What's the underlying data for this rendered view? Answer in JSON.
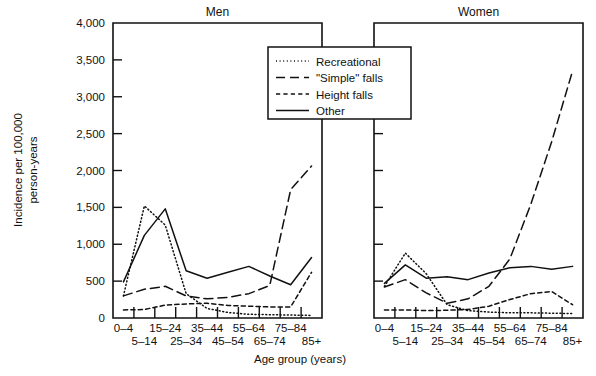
{
  "figure": {
    "y_axis_title": "Incidence per 100,000 person-years",
    "y_axis_title_line1": "Incidence per 100,000",
    "y_axis_title_line2": "person-years",
    "x_axis_title": "Age group (years)",
    "panels": [
      {
        "name": "men",
        "title": "Men"
      },
      {
        "name": "women",
        "title": "Women"
      }
    ]
  },
  "legend": {
    "position": "top-center",
    "items": [
      {
        "label": "Recreational",
        "style": "dotted"
      },
      {
        "label": "\"Simple\" falls",
        "style": "long-dash"
      },
      {
        "label": "Height falls",
        "style": "short-dash"
      },
      {
        "label": "Other",
        "style": "solid"
      }
    ]
  },
  "chart_data": {
    "type": "line",
    "title": "",
    "subtitle": "",
    "xlabel": "Age group (years)",
    "ylabel": "Incidence per 100,000 person-years",
    "ylim": [
      0,
      4000
    ],
    "ytick_values": [
      0,
      500,
      1000,
      1500,
      2000,
      2500,
      3000,
      3500,
      4000
    ],
    "ytick_labels": [
      "0",
      "500",
      "1,000",
      "1,500",
      "2,000",
      "2,500",
      "3,000",
      "3,500",
      "4,000"
    ],
    "grid": false,
    "legend_position": "top-center",
    "categories": [
      "0–4",
      "5–14",
      "15–24",
      "25–34",
      "35–44",
      "45–54",
      "55–64",
      "65–74",
      "75–84",
      "85+"
    ],
    "panels": [
      {
        "name": "Men",
        "series": [
          {
            "name": "Recreational",
            "style": "dotted",
            "values": [
              300,
              1520,
              1260,
              330,
              130,
              75,
              50,
              45,
              40,
              35
            ]
          },
          {
            "name": "\"Simple\" falls",
            "style": "long-dash",
            "values": [
              300,
              390,
              430,
              300,
              260,
              280,
              330,
              440,
              1740,
              2060
            ]
          },
          {
            "name": "Height falls",
            "style": "short-dash",
            "values": [
              110,
              115,
              175,
              190,
              200,
              170,
              160,
              150,
              150,
              620
            ]
          },
          {
            "name": "Other",
            "style": "solid",
            "values": [
              490,
              1120,
              1480,
              640,
              540,
              620,
              700,
              570,
              450,
              820
            ]
          }
        ]
      },
      {
        "name": "Women",
        "series": [
          {
            "name": "Recreational",
            "style": "dotted",
            "values": [
              430,
              880,
              600,
              180,
              100,
              80,
              70,
              70,
              65,
              60
            ]
          },
          {
            "name": "\"Simple\" falls",
            "style": "long-dash",
            "values": [
              420,
              520,
              340,
              200,
              260,
              430,
              800,
              1540,
              2390,
              3350
            ]
          },
          {
            "name": "Height falls",
            "style": "short-dash",
            "values": [
              110,
              110,
              100,
              105,
              115,
              160,
              250,
              330,
              360,
              180
            ]
          },
          {
            "name": "Other",
            "style": "solid",
            "values": [
              470,
              720,
              540,
              560,
              520,
              610,
              680,
              700,
              660,
              700
            ]
          }
        ]
      }
    ]
  }
}
